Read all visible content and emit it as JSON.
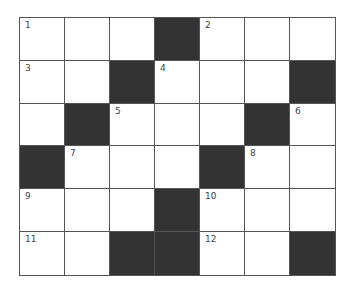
{
  "puzzle": {
    "rows": 6,
    "cols": 7,
    "colors": {
      "block": "#333333",
      "cell": "#ffffff",
      "line": "#555555"
    },
    "grid": [
      [
        {
          "n": "1"
        },
        {},
        {},
        {
          "b": true
        },
        {
          "n": "2"
        },
        {},
        {}
      ],
      [
        {
          "n": "3"
        },
        {},
        {
          "b": true
        },
        {
          "n": "4"
        },
        {},
        {},
        {
          "b": true
        }
      ],
      [
        {},
        {
          "b": true
        },
        {
          "n": "5"
        },
        {},
        {},
        {
          "b": true
        },
        {
          "n": "6"
        }
      ],
      [
        {
          "b": true
        },
        {
          "n": "7"
        },
        {},
        {},
        {
          "b": true
        },
        {
          "n": "8"
        },
        {}
      ],
      [
        {
          "n": "9"
        },
        {},
        {},
        {
          "b": true
        },
        {
          "n": "10"
        },
        {},
        {}
      ],
      [
        {
          "n": "11"
        },
        {},
        {
          "b": true
        },
        {
          "b": true
        },
        {
          "n": "12"
        },
        {},
        {
          "b": true
        }
      ]
    ]
  }
}
